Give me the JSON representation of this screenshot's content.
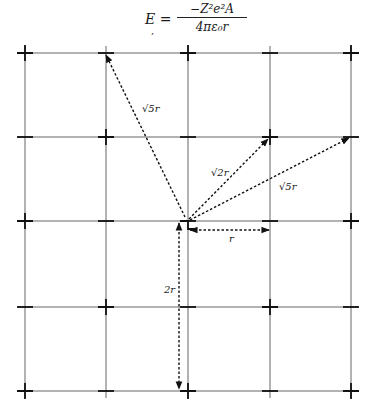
{
  "equation": {
    "lhs": "E =",
    "numerator": "−Z²e²A",
    "denominator": "4πε₀r",
    "mark": ","
  },
  "diagram": {
    "grid_columns_px": [
      25,
      106,
      188,
      270,
      351
    ],
    "grid_rows_px": [
      53,
      137,
      221,
      307,
      391
    ],
    "origin": {
      "col": 2,
      "row": 2
    },
    "arrows": [
      {
        "name": "arrow-sqrt5r-upper-left",
        "to": {
          "col": 1,
          "row": 0
        },
        "label": "√5r"
      },
      {
        "name": "arrow-sqrt2r",
        "to": {
          "col": 3,
          "row": 1
        },
        "label": "√2r"
      },
      {
        "name": "arrow-sqrt5r-right",
        "to": {
          "col": 4,
          "row": 1
        },
        "label": "√5r"
      },
      {
        "name": "arrow-r",
        "to": {
          "col": 3,
          "row": 2
        },
        "label": "r"
      },
      {
        "name": "arrow-2r",
        "to": {
          "col": 2,
          "row": 4
        },
        "label": "2r"
      }
    ],
    "labels": {
      "sqrt5r_a": "√5r",
      "sqrt2r": "√2r",
      "sqrt5r_b": "√5r",
      "r": "r",
      "two_r": "2r"
    },
    "line_color": "#222222"
  }
}
